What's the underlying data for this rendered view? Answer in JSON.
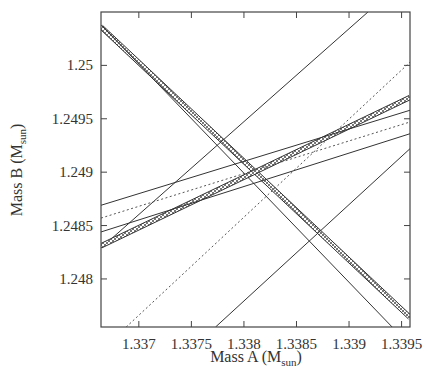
{
  "chart_data": {
    "type": "line",
    "title": "",
    "xlabel": "Mass A (M_sun)",
    "ylabel": "Mass B (M_sun)",
    "xlabel_parts": {
      "main": "Mass A (M",
      "sub": "sun",
      "close": ")"
    },
    "ylabel_parts": {
      "main": "Mass B (M",
      "sub": "sun",
      "close": ")"
    },
    "xlim": [
      1.33664,
      1.33958
    ],
    "ylim": [
      1.24755,
      1.2505
    ],
    "x_ticks": [
      1.337,
      1.3375,
      1.338,
      1.3385,
      1.339,
      1.3395
    ],
    "x_tick_labels": [
      "1.337",
      "1.3375",
      "1.338",
      "1.3385",
      "1.339",
      "1.3395"
    ],
    "y_ticks": [
      1.248,
      1.2485,
      1.249,
      1.2495,
      1.25
    ],
    "y_tick_labels": [
      "1.248",
      "1.2485",
      "1.249",
      "1.2495",
      "1.25"
    ],
    "grid": false,
    "legend": null,
    "series": [
      {
        "name": "constraint-1-steep-down-band",
        "style": "hatched-band",
        "points": [
          [
            1.33664,
            1.25036
          ],
          [
            1.33958,
            1.24764
          ]
        ]
      },
      {
        "name": "constraint-2-steep-down",
        "style": "solid",
        "points": [
          [
            1.33664,
            1.25038
          ],
          [
            1.33941,
            1.24755
          ]
        ]
      },
      {
        "name": "constraint-3-steep-up",
        "style": "solid",
        "points": [
          [
            1.33664,
            1.24829
          ],
          [
            1.33918,
            1.2505
          ]
        ]
      },
      {
        "name": "constraint-4-steep-up",
        "style": "solid",
        "points": [
          [
            1.33773,
            1.24755
          ],
          [
            1.33958,
            1.24922
          ]
        ]
      },
      {
        "name": "constraint-5-steep-up",
        "style": "dotted",
        "points": [
          [
            1.33688,
            1.24755
          ],
          [
            1.33958,
            1.25003
          ]
        ]
      },
      {
        "name": "constraint-6-shallow-band",
        "style": "hatched-band",
        "points": [
          [
            1.33664,
            1.24831
          ],
          [
            1.33958,
            1.2497
          ]
        ]
      },
      {
        "name": "constraint-7-shallow",
        "style": "solid",
        "points": [
          [
            1.33664,
            1.24869
          ],
          [
            1.33958,
            1.24958
          ]
        ]
      },
      {
        "name": "constraint-8-shallow",
        "style": "dotted",
        "points": [
          [
            1.33664,
            1.24857
          ],
          [
            1.33958,
            1.24947
          ]
        ]
      },
      {
        "name": "constraint-9-shallow",
        "style": "solid",
        "points": [
          [
            1.33664,
            1.24844
          ],
          [
            1.33958,
            1.24936
          ]
        ]
      }
    ]
  }
}
